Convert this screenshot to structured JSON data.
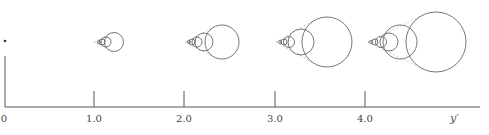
{
  "figure": {
    "type": "diagram",
    "colors": {
      "line": "#555555",
      "circle": "#666666",
      "background": "#ffffff"
    }
  },
  "axis": {
    "label": "y′",
    "origin_label": "0",
    "ticks": [
      {
        "value": 1.0,
        "label": "1.0",
        "x": 94
      },
      {
        "value": 2.0,
        "label": "2.0",
        "x": 184
      },
      {
        "value": 3.0,
        "label": "3.0",
        "x": 275
      },
      {
        "value": 4.0,
        "label": "4.0",
        "x": 365
      }
    ]
  },
  "groups": [
    {
      "at": "0",
      "circles": []
    },
    {
      "at": "1.0",
      "vertex_x": 94,
      "circles": [
        {
          "cx": 99,
          "r": 1.5
        },
        {
          "cx": 102,
          "r": 3
        },
        {
          "cx": 106,
          "r": 5
        },
        {
          "cx": 114,
          "r": 9.5
        }
      ]
    },
    {
      "at": "2.0",
      "vertex_x": 185,
      "circles": [
        {
          "cx": 189,
          "r": 1.5
        },
        {
          "cx": 192,
          "r": 3
        },
        {
          "cx": 197,
          "r": 5
        },
        {
          "cx": 204,
          "r": 9
        },
        {
          "cx": 222,
          "r": 17
        }
      ]
    },
    {
      "at": "3.0",
      "vertex_x": 276,
      "circles": [
        {
          "cx": 280,
          "r": 1.5
        },
        {
          "cx": 284,
          "r": 3
        },
        {
          "cx": 289,
          "r": 5.5
        },
        {
          "cx": 301,
          "r": 13
        },
        {
          "cx": 327,
          "r": 25
        }
      ]
    },
    {
      "at": "4.0",
      "vertex_x": 368,
      "circles": [
        {
          "cx": 371,
          "r": 1.5
        },
        {
          "cx": 375,
          "r": 3
        },
        {
          "cx": 381,
          "r": 5.5
        },
        {
          "cx": 389,
          "r": 9
        },
        {
          "cx": 400,
          "r": 17
        },
        {
          "cx": 436,
          "r": 30
        }
      ]
    }
  ]
}
